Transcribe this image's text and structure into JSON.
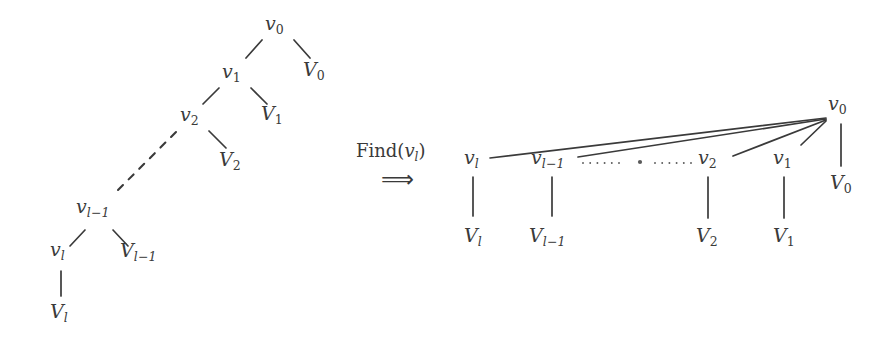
{
  "figure": {
    "background_color": "#ffffff",
    "ink_color": "#3a3a3a",
    "width": 895,
    "height": 345
  },
  "operation": {
    "name": "Find",
    "arg_base": "v",
    "arg_sub": "l",
    "label_text": "Find(",
    "label_close": ")",
    "arrow": "⟹"
  },
  "left_tree": {
    "caption": "before find",
    "nodes": [
      {
        "id": "v0",
        "base": "v",
        "sub": "0",
        "x": 265,
        "y": 14,
        "kind": "internal"
      },
      {
        "id": "V0",
        "base": "V",
        "sub": "0",
        "x": 303,
        "y": 60,
        "kind": "leaf"
      },
      {
        "id": "v1",
        "base": "v",
        "sub": "1",
        "x": 222,
        "y": 62,
        "kind": "internal"
      },
      {
        "id": "V1",
        "base": "V",
        "sub": "1",
        "x": 261,
        "y": 104,
        "kind": "leaf"
      },
      {
        "id": "v2",
        "base": "v",
        "sub": "2",
        "x": 180,
        "y": 105,
        "kind": "internal"
      },
      {
        "id": "V2",
        "base": "V",
        "sub": "2",
        "x": 219,
        "y": 150,
        "kind": "leaf"
      },
      {
        "id": "vl1",
        "base": "v",
        "sub": "l-1",
        "x": 76,
        "y": 197,
        "kind": "internal"
      },
      {
        "id": "Vl1",
        "base": "V",
        "sub": "l-1",
        "x": 120,
        "y": 241,
        "kind": "leaf"
      },
      {
        "id": "vl",
        "base": "v",
        "sub": "l",
        "x": 50,
        "y": 240,
        "kind": "internal"
      },
      {
        "id": "Vl",
        "base": "V",
        "sub": "l",
        "x": 50,
        "y": 302,
        "kind": "leaf"
      }
    ],
    "edges": [
      {
        "from": "v0",
        "to": "v1",
        "style": "solid",
        "x1": 262,
        "y1": 40,
        "x2": 246,
        "y2": 58
      },
      {
        "from": "v0",
        "to": "V0",
        "style": "solid",
        "x1": 294,
        "y1": 40,
        "x2": 310,
        "y2": 58
      },
      {
        "from": "v1",
        "to": "v2",
        "style": "solid",
        "x1": 219,
        "y1": 88,
        "x2": 203,
        "y2": 104
      },
      {
        "from": "v1",
        "to": "V1",
        "style": "solid",
        "x1": 251,
        "y1": 88,
        "x2": 267,
        "y2": 104
      },
      {
        "from": "v2",
        "to": "vl1",
        "style": "dashed",
        "x1": 176,
        "y1": 132,
        "x2": 117,
        "y2": 191
      },
      {
        "from": "v2",
        "to": "V2",
        "style": "solid",
        "x1": 209,
        "y1": 131,
        "x2": 226,
        "y2": 148
      },
      {
        "from": "vl1",
        "to": "vl",
        "style": "solid",
        "x1": 85,
        "y1": 230,
        "x2": 70,
        "y2": 246
      },
      {
        "from": "vl1",
        "to": "Vl1",
        "style": "solid",
        "x1": 113,
        "y1": 230,
        "x2": 128,
        "y2": 246
      },
      {
        "from": "vl",
        "to": "Vl",
        "style": "solid",
        "x1": 61,
        "y1": 271,
        "x2": 61,
        "y2": 296
      }
    ]
  },
  "right_tree": {
    "caption": "after find (path compressed)",
    "root_apex": {
      "x": 828,
      "y": 118
    },
    "nodes": [
      {
        "id": "vl",
        "base": "v",
        "sub": "l",
        "x": 464,
        "y": 148,
        "kind": "child"
      },
      {
        "id": "Vl",
        "base": "V",
        "sub": "l",
        "x": 464,
        "y": 226,
        "kind": "leaf"
      },
      {
        "id": "vl1",
        "base": "v",
        "sub": "l-1",
        "x": 531,
        "y": 148,
        "kind": "child"
      },
      {
        "id": "Vl1",
        "base": "V",
        "sub": "l-1",
        "x": 529,
        "y": 226,
        "kind": "leaf"
      },
      {
        "id": "v2",
        "base": "v",
        "sub": "2",
        "x": 698,
        "y": 148,
        "kind": "child"
      },
      {
        "id": "V2",
        "base": "V",
        "sub": "2",
        "x": 696,
        "y": 226,
        "kind": "leaf"
      },
      {
        "id": "v1",
        "base": "v",
        "sub": "1",
        "x": 773,
        "y": 148,
        "kind": "child"
      },
      {
        "id": "V1",
        "base": "V",
        "sub": "1",
        "x": 773,
        "y": 226,
        "kind": "leaf"
      },
      {
        "id": "v0",
        "base": "v",
        "sub": "0",
        "x": 828,
        "y": 94,
        "kind": "root"
      },
      {
        "id": "V0",
        "base": "V",
        "sub": "0",
        "x": 830,
        "y": 173,
        "kind": "leaf"
      }
    ],
    "edges": [
      {
        "from": "v0",
        "to": "vl",
        "style": "solid",
        "x1": 826,
        "y1": 118,
        "x2": 490,
        "y2": 158
      },
      {
        "from": "v0",
        "to": "vl1",
        "style": "solid",
        "x1": 826,
        "y1": 119,
        "x2": 578,
        "y2": 157
      },
      {
        "from": "v0",
        "to": "v2",
        "style": "solid",
        "x1": 826,
        "y1": 120,
        "x2": 733,
        "y2": 156
      },
      {
        "from": "v0",
        "to": "v1",
        "style": "solid",
        "x1": 826,
        "y1": 121,
        "x2": 801,
        "y2": 145
      },
      {
        "from": "v0",
        "to": "V0",
        "style": "solid",
        "x1": 841,
        "y1": 124,
        "x2": 841,
        "y2": 166
      },
      {
        "from": "vl",
        "to": "Vl",
        "style": "solid",
        "x1": 473,
        "y1": 177,
        "x2": 473,
        "y2": 216
      },
      {
        "from": "vl1",
        "to": "Vl1",
        "style": "solid",
        "x1": 552,
        "y1": 177,
        "x2": 552,
        "y2": 216
      },
      {
        "from": "v2",
        "to": "V2",
        "style": "solid",
        "x1": 708,
        "y1": 177,
        "x2": 708,
        "y2": 218
      },
      {
        "from": "v1",
        "to": "V1",
        "style": "solid",
        "x1": 784,
        "y1": 177,
        "x2": 784,
        "y2": 218
      }
    ],
    "ellipsis": {
      "x1": 583,
      "y1": 163,
      "x2": 697,
      "y2": 163,
      "center_dot_x": 640,
      "center_dot_y": 162
    }
  }
}
